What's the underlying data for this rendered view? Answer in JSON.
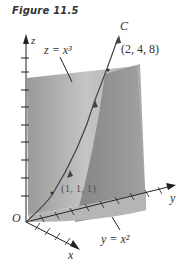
{
  "figure": {
    "caption": "Figure 11.5"
  },
  "labels": {
    "z_axis": "z",
    "x_axis": "x",
    "y_axis": "y",
    "origin": "O",
    "curve": "C",
    "surface_z": "z = x³",
    "surface_y": "y = x²",
    "point_end": "(2, 4, 8)",
    "point_mid": "(1, 1, 1)"
  },
  "colors": {
    "surface_light": "#c8c8c8",
    "surface_mid": "#a9a9a9",
    "surface_dark": "#8a8a8a",
    "curve": "#444444",
    "axis": "#222222"
  }
}
